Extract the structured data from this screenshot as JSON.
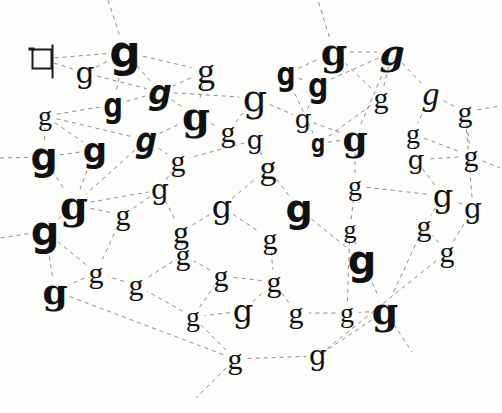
{
  "figure": {
    "background_color": "#fdfdfc",
    "ink_color": "#111111",
    "edge_color": "#8d8d8d",
    "edge_style": "dashed",
    "canvas": {
      "width": 502,
      "height": 413
    }
  },
  "nodes": [
    {
      "id": "n0",
      "label": "q",
      "x": 42,
      "y": 59,
      "size": 30,
      "font": "f-mono",
      "weight": "w-normal",
      "style": "s-normal",
      "kind": "skeleton"
    },
    {
      "id": "n1",
      "label": "g",
      "x": 85,
      "y": 73,
      "size": 30,
      "font": "f-dserif",
      "weight": "w-normal",
      "style": "s-normal",
      "kind": "glyph"
    },
    {
      "id": "n2",
      "label": "g",
      "x": 125,
      "y": 52,
      "size": 44,
      "font": "f-dsans",
      "weight": "w-bold",
      "style": "s-normal",
      "kind": "glyph"
    },
    {
      "id": "n3",
      "label": "g",
      "x": 113,
      "y": 105,
      "size": 33,
      "font": "f-dmono",
      "weight": "w-bold",
      "style": "s-normal",
      "kind": "glyph"
    },
    {
      "id": "n4",
      "label": "g",
      "x": 160,
      "y": 92,
      "size": 33,
      "font": "f-dsans",
      "weight": "w-bold",
      "style": "s-italic",
      "kind": "glyph"
    },
    {
      "id": "n5",
      "label": "g",
      "x": 206,
      "y": 71,
      "size": 36,
      "font": "f-serif",
      "weight": "w-normal",
      "style": "s-normal",
      "kind": "glyph"
    },
    {
      "id": "n6",
      "label": "g",
      "x": 196,
      "y": 116,
      "size": 40,
      "font": "f-dserif",
      "weight": "w-bold",
      "style": "s-normal",
      "kind": "glyph"
    },
    {
      "id": "n7",
      "label": "g",
      "x": 228,
      "y": 132,
      "size": 30,
      "font": "f-serif",
      "weight": "w-normal",
      "style": "s-normal",
      "kind": "glyph"
    },
    {
      "id": "n8",
      "label": "g",
      "x": 255,
      "y": 98,
      "size": 38,
      "font": "f-dserif",
      "weight": "w-normal",
      "style": "s-normal",
      "kind": "glyph"
    },
    {
      "id": "n9",
      "label": "g",
      "x": 45,
      "y": 116,
      "size": 28,
      "font": "f-serif",
      "weight": "w-normal",
      "style": "s-normal",
      "kind": "glyph"
    },
    {
      "id": "n10",
      "label": "g",
      "x": 44,
      "y": 157,
      "size": 38,
      "font": "f-dsans",
      "weight": "w-bold",
      "style": "s-normal",
      "kind": "glyph"
    },
    {
      "id": "n11",
      "label": "g",
      "x": 95,
      "y": 150,
      "size": 34,
      "font": "f-dsans",
      "weight": "w-bold",
      "style": "s-normal",
      "kind": "glyph"
    },
    {
      "id": "n12",
      "label": "g",
      "x": 146,
      "y": 140,
      "size": 36,
      "font": "f-dmono",
      "weight": "w-bold",
      "style": "s-italic",
      "kind": "glyph"
    },
    {
      "id": "n13",
      "label": "g",
      "x": 74,
      "y": 205,
      "size": 40,
      "font": "f-dserif",
      "weight": "w-bold",
      "style": "s-normal",
      "kind": "glyph"
    },
    {
      "id": "n14",
      "label": "g",
      "x": 45,
      "y": 231,
      "size": 40,
      "font": "f-dsans",
      "weight": "w-bold",
      "style": "s-normal",
      "kind": "glyph"
    },
    {
      "id": "n15",
      "label": "g",
      "x": 123,
      "y": 215,
      "size": 30,
      "font": "f-serif",
      "weight": "w-normal",
      "style": "s-normal",
      "kind": "glyph"
    },
    {
      "id": "n16",
      "label": "g",
      "x": 160,
      "y": 190,
      "size": 28,
      "font": "f-dserif",
      "weight": "w-normal",
      "style": "s-normal",
      "kind": "glyph"
    },
    {
      "id": "n17",
      "label": "g",
      "x": 181,
      "y": 232,
      "size": 32,
      "font": "f-serif",
      "weight": "w-normal",
      "style": "s-normal",
      "kind": "glyph"
    },
    {
      "id": "n18",
      "label": "g",
      "x": 222,
      "y": 207,
      "size": 32,
      "font": "f-dserif",
      "weight": "w-normal",
      "style": "s-normal",
      "kind": "glyph"
    },
    {
      "id": "n19",
      "label": "g",
      "x": 268,
      "y": 168,
      "size": 34,
      "font": "f-serif",
      "weight": "w-normal",
      "style": "s-normal",
      "kind": "glyph"
    },
    {
      "id": "n20",
      "label": "g",
      "x": 299,
      "y": 209,
      "size": 38,
      "font": "f-dsans",
      "weight": "w-bold",
      "style": "s-normal",
      "kind": "glyph"
    },
    {
      "id": "n21",
      "label": "g",
      "x": 286,
      "y": 74,
      "size": 32,
      "font": "f-dmono",
      "weight": "w-bold",
      "style": "s-normal",
      "kind": "glyph"
    },
    {
      "id": "n22",
      "label": "g",
      "x": 318,
      "y": 85,
      "size": 34,
      "font": "f-dmono",
      "weight": "w-bold",
      "style": "s-normal",
      "kind": "glyph"
    },
    {
      "id": "n23",
      "label": "g",
      "x": 334,
      "y": 52,
      "size": 38,
      "font": "f-dserif",
      "weight": "w-bold",
      "style": "s-normal",
      "kind": "glyph"
    },
    {
      "id": "n24",
      "label": "g",
      "x": 392,
      "y": 52,
      "size": 36,
      "font": "f-dserif",
      "weight": "w-bold",
      "style": "s-italic",
      "kind": "glyph"
    },
    {
      "id": "n25",
      "label": "g",
      "x": 381,
      "y": 98,
      "size": 30,
      "font": "f-serif",
      "weight": "w-normal",
      "style": "s-normal",
      "kind": "glyph"
    },
    {
      "id": "n26",
      "label": "g",
      "x": 355,
      "y": 138,
      "size": 36,
      "font": "f-dserif",
      "weight": "w-bold",
      "style": "s-normal",
      "kind": "glyph"
    },
    {
      "id": "n27",
      "label": "g",
      "x": 318,
      "y": 144,
      "size": 24,
      "font": "f-dmono",
      "weight": "w-bold",
      "style": "s-normal",
      "kind": "glyph"
    },
    {
      "id": "n28",
      "label": "g",
      "x": 431,
      "y": 94,
      "size": 34,
      "font": "f-serif",
      "weight": "w-normal",
      "style": "s-italic",
      "kind": "glyph"
    },
    {
      "id": "n29",
      "label": "g",
      "x": 465,
      "y": 112,
      "size": 30,
      "font": "f-serif",
      "weight": "w-normal",
      "style": "s-normal",
      "kind": "glyph"
    },
    {
      "id": "n30",
      "label": "g",
      "x": 413,
      "y": 134,
      "size": 28,
      "font": "f-serif",
      "weight": "w-normal",
      "style": "s-normal",
      "kind": "glyph"
    },
    {
      "id": "n31",
      "label": "g",
      "x": 471,
      "y": 156,
      "size": 30,
      "font": "f-serif",
      "weight": "w-normal",
      "style": "s-normal",
      "kind": "glyph"
    },
    {
      "id": "n32",
      "label": "g",
      "x": 416,
      "y": 160,
      "size": 26,
      "font": "f-dserif",
      "weight": "w-normal",
      "style": "s-normal",
      "kind": "glyph"
    },
    {
      "id": "n33",
      "label": "g",
      "x": 355,
      "y": 186,
      "size": 28,
      "font": "f-serif",
      "weight": "w-normal",
      "style": "s-normal",
      "kind": "glyph"
    },
    {
      "id": "n34",
      "label": "g",
      "x": 443,
      "y": 196,
      "size": 32,
      "font": "f-dserif",
      "weight": "w-normal",
      "style": "s-normal",
      "kind": "glyph"
    },
    {
      "id": "n35",
      "label": "g",
      "x": 424,
      "y": 226,
      "size": 30,
      "font": "f-serif",
      "weight": "w-normal",
      "style": "s-normal",
      "kind": "glyph"
    },
    {
      "id": "n36",
      "label": "g",
      "x": 362,
      "y": 260,
      "size": 40,
      "font": "f-dsans",
      "weight": "w-bold",
      "style": "s-normal",
      "kind": "glyph"
    },
    {
      "id": "n37",
      "label": "g",
      "x": 385,
      "y": 311,
      "size": 38,
      "font": "f-dserif",
      "weight": "w-bold",
      "style": "s-normal",
      "kind": "glyph"
    },
    {
      "id": "n38",
      "label": "g",
      "x": 347,
      "y": 313,
      "size": 28,
      "font": "f-serif",
      "weight": "w-normal",
      "style": "s-normal",
      "kind": "glyph"
    },
    {
      "id": "n39",
      "label": "g",
      "x": 296,
      "y": 313,
      "size": 30,
      "font": "f-serif",
      "weight": "w-normal",
      "style": "s-normal",
      "kind": "glyph"
    },
    {
      "id": "n40",
      "label": "g",
      "x": 243,
      "y": 311,
      "size": 32,
      "font": "f-dserif",
      "weight": "w-normal",
      "style": "s-normal",
      "kind": "glyph"
    },
    {
      "id": "n41",
      "label": "g",
      "x": 193,
      "y": 317,
      "size": 28,
      "font": "f-serif",
      "weight": "w-normal",
      "style": "s-normal",
      "kind": "glyph"
    },
    {
      "id": "n42",
      "label": "g",
      "x": 235,
      "y": 359,
      "size": 30,
      "font": "f-serif",
      "weight": "w-normal",
      "style": "s-normal",
      "kind": "glyph"
    },
    {
      "id": "n43",
      "label": "g",
      "x": 318,
      "y": 356,
      "size": 28,
      "font": "f-dserif",
      "weight": "w-normal",
      "style": "s-normal",
      "kind": "glyph"
    },
    {
      "id": "n44",
      "label": "g",
      "x": 274,
      "y": 282,
      "size": 30,
      "font": "f-serif",
      "weight": "w-normal",
      "style": "s-normal",
      "kind": "glyph"
    },
    {
      "id": "n45",
      "label": "g",
      "x": 221,
      "y": 276,
      "size": 30,
      "font": "f-serif",
      "weight": "w-normal",
      "style": "s-normal",
      "kind": "glyph"
    },
    {
      "id": "n46",
      "label": "g",
      "x": 183,
      "y": 255,
      "size": 30,
      "font": "f-serif",
      "weight": "w-normal",
      "style": "s-normal",
      "kind": "glyph"
    },
    {
      "id": "n47",
      "label": "g",
      "x": 136,
      "y": 285,
      "size": 30,
      "font": "f-serif",
      "weight": "w-normal",
      "style": "s-normal",
      "kind": "glyph"
    },
    {
      "id": "n48",
      "label": "g",
      "x": 96,
      "y": 273,
      "size": 30,
      "font": "f-serif",
      "weight": "w-normal",
      "style": "s-normal",
      "kind": "glyph"
    },
    {
      "id": "n49",
      "label": "g",
      "x": 55,
      "y": 291,
      "size": 36,
      "font": "f-dserif",
      "weight": "w-bold",
      "style": "s-normal",
      "kind": "glyph"
    },
    {
      "id": "n50",
      "label": "g",
      "x": 270,
      "y": 239,
      "size": 30,
      "font": "f-serif",
      "weight": "w-normal",
      "style": "s-normal",
      "kind": "glyph"
    },
    {
      "id": "n51",
      "label": "g",
      "x": 255,
      "y": 140,
      "size": 26,
      "font": "f-dserif",
      "weight": "w-normal",
      "style": "s-normal",
      "kind": "glyph"
    },
    {
      "id": "n52",
      "label": "g",
      "x": 350,
      "y": 230,
      "size": 26,
      "font": "f-serif",
      "weight": "w-normal",
      "style": "s-normal",
      "kind": "glyph"
    },
    {
      "id": "n53",
      "label": "g",
      "x": 473,
      "y": 209,
      "size": 28,
      "font": "f-dserif",
      "weight": "w-normal",
      "style": "s-normal",
      "kind": "glyph"
    },
    {
      "id": "n54",
      "label": "g",
      "x": 447,
      "y": 252,
      "size": 30,
      "font": "f-serif",
      "weight": "w-normal",
      "style": "s-normal",
      "kind": "glyph"
    },
    {
      "id": "n55",
      "label": "g",
      "x": 178,
      "y": 161,
      "size": 30,
      "font": "f-serif",
      "weight": "w-normal",
      "style": "s-normal",
      "kind": "glyph"
    },
    {
      "id": "n56",
      "label": "g",
      "x": 303,
      "y": 119,
      "size": 26,
      "font": "f-dserif",
      "weight": "w-normal",
      "style": "s-normal",
      "kind": "glyph"
    }
  ],
  "edges": [
    [
      "n0",
      "n1"
    ],
    [
      "n0",
      "n2"
    ],
    [
      "n1",
      "n2"
    ],
    [
      "n1",
      "n4"
    ],
    [
      "n2",
      "n3"
    ],
    [
      "n2",
      "n4"
    ],
    [
      "n2",
      "n5"
    ],
    [
      "n3",
      "n4"
    ],
    [
      "n4",
      "n5"
    ],
    [
      "n4",
      "n6"
    ],
    [
      "n4",
      "n8"
    ],
    [
      "n5",
      "n6"
    ],
    [
      "n6",
      "n7"
    ],
    [
      "n7",
      "n8"
    ],
    [
      "n8",
      "n56"
    ],
    [
      "n9",
      "n3"
    ],
    [
      "n9",
      "n10"
    ],
    [
      "n9",
      "n11"
    ],
    [
      "n9",
      "n12"
    ],
    [
      "n10",
      "n11"
    ],
    [
      "n10",
      "n13"
    ],
    [
      "n11",
      "n13"
    ],
    [
      "n12",
      "n6"
    ],
    [
      "n12",
      "n13"
    ],
    [
      "n12",
      "n55"
    ],
    [
      "n13",
      "n14"
    ],
    [
      "n13",
      "n15"
    ],
    [
      "n13",
      "n16"
    ],
    [
      "n14",
      "n48"
    ],
    [
      "n15",
      "n16"
    ],
    [
      "n15",
      "n48"
    ],
    [
      "n16",
      "n17"
    ],
    [
      "n16",
      "n55"
    ],
    [
      "n17",
      "n18"
    ],
    [
      "n17",
      "n46"
    ],
    [
      "n18",
      "n19"
    ],
    [
      "n18",
      "n50"
    ],
    [
      "n19",
      "n20"
    ],
    [
      "n19",
      "n51"
    ],
    [
      "n20",
      "n36"
    ],
    [
      "n21",
      "n22"
    ],
    [
      "n21",
      "n23"
    ],
    [
      "n21",
      "n27"
    ],
    [
      "n22",
      "n23"
    ],
    [
      "n22",
      "n24"
    ],
    [
      "n22",
      "n56"
    ],
    [
      "n23",
      "n24"
    ],
    [
      "n23",
      "n25"
    ],
    [
      "n24",
      "n25"
    ],
    [
      "n24",
      "n28"
    ],
    [
      "n25",
      "n27"
    ],
    [
      "n26",
      "n24"
    ],
    [
      "n26",
      "n33"
    ],
    [
      "n27",
      "n26"
    ],
    [
      "n28",
      "n29"
    ],
    [
      "n28",
      "n30"
    ],
    [
      "n29",
      "n31"
    ],
    [
      "n30",
      "n31"
    ],
    [
      "n30",
      "n32"
    ],
    [
      "n31",
      "n32"
    ],
    [
      "n32",
      "n34"
    ],
    [
      "n33",
      "n34"
    ],
    [
      "n34",
      "n35"
    ],
    [
      "n35",
      "n37"
    ],
    [
      "n36",
      "n37"
    ],
    [
      "n36",
      "n52"
    ],
    [
      "n37",
      "n38"
    ],
    [
      "n37",
      "n43"
    ],
    [
      "n38",
      "n39"
    ],
    [
      "n39",
      "n44"
    ],
    [
      "n40",
      "n41"
    ],
    [
      "n40",
      "n44"
    ],
    [
      "n41",
      "n45"
    ],
    [
      "n41",
      "n47"
    ],
    [
      "n42",
      "n41"
    ],
    [
      "n42",
      "n43"
    ],
    [
      "n44",
      "n45"
    ],
    [
      "n45",
      "n46"
    ],
    [
      "n46",
      "n47"
    ],
    [
      "n47",
      "n48"
    ],
    [
      "n48",
      "n49"
    ],
    [
      "n49",
      "n14"
    ],
    [
      "n50",
      "n44"
    ],
    [
      "n51",
      "n55"
    ],
    [
      "n52",
      "n33"
    ],
    [
      "n52",
      "n38"
    ],
    [
      "n53",
      "n34"
    ],
    [
      "n53",
      "n29"
    ],
    [
      "n54",
      "n35"
    ],
    [
      "n54",
      "n53"
    ],
    [
      "n56",
      "n26"
    ],
    [
      "n43",
      "n54"
    ],
    [
      "n42",
      "n49"
    ]
  ],
  "open_edges": [
    {
      "from": "n2",
      "to_x": 108,
      "to_y": 0
    },
    {
      "from": "n23",
      "to_x": 318,
      "to_y": 0
    },
    {
      "from": "n10",
      "to_x": 0,
      "to_y": 158
    },
    {
      "from": "n14",
      "to_x": 0,
      "to_y": 238
    },
    {
      "from": "n42",
      "to_x": 196,
      "to_y": 398
    },
    {
      "from": "n37",
      "to_x": 412,
      "to_y": 352
    },
    {
      "from": "n31",
      "to_x": 500,
      "to_y": 168
    },
    {
      "from": "n29",
      "to_x": 500,
      "to_y": 106
    }
  ]
}
